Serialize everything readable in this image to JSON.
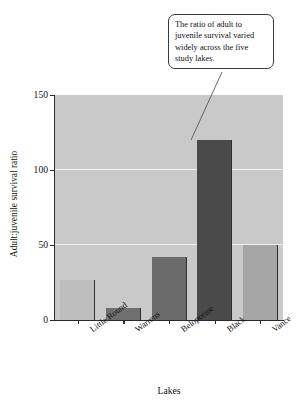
{
  "chart_data": {
    "type": "bar",
    "title": "",
    "xlabel": "Lakes",
    "ylabel": "Adult:juvenile survival ratio",
    "categories": [
      "Little Round",
      "Warrens",
      "Beloporine",
      "Black",
      "Vance"
    ],
    "values": [
      27,
      8,
      42,
      120,
      50
    ],
    "ylim": [
      0,
      150
    ],
    "yticks": [
      0,
      50,
      100,
      150
    ],
    "ytick_labels": [
      "0",
      "50",
      "100",
      "150"
    ],
    "grid": true,
    "grid_axis": "y",
    "legend": false,
    "bar_colors": [
      "#bdbdbd",
      "#6f6f6f",
      "#6b6b6b",
      "#4a4a4a",
      "#a6a6a6"
    ],
    "plot_background": "#c9c9c9",
    "gridline_color": "#f0f0f0",
    "axis_color": "#2a2a2a",
    "annotations": [
      {
        "text": "The ratio of adult to juvenile survival varied widely across the five study lakes.",
        "points_to_category": "Black",
        "points_to_value": 120
      }
    ]
  },
  "callout": {
    "line1": "The ratio of adult to",
    "line2": "juvenile survival varied",
    "line3": "widely across the five",
    "line4": "study lakes."
  }
}
